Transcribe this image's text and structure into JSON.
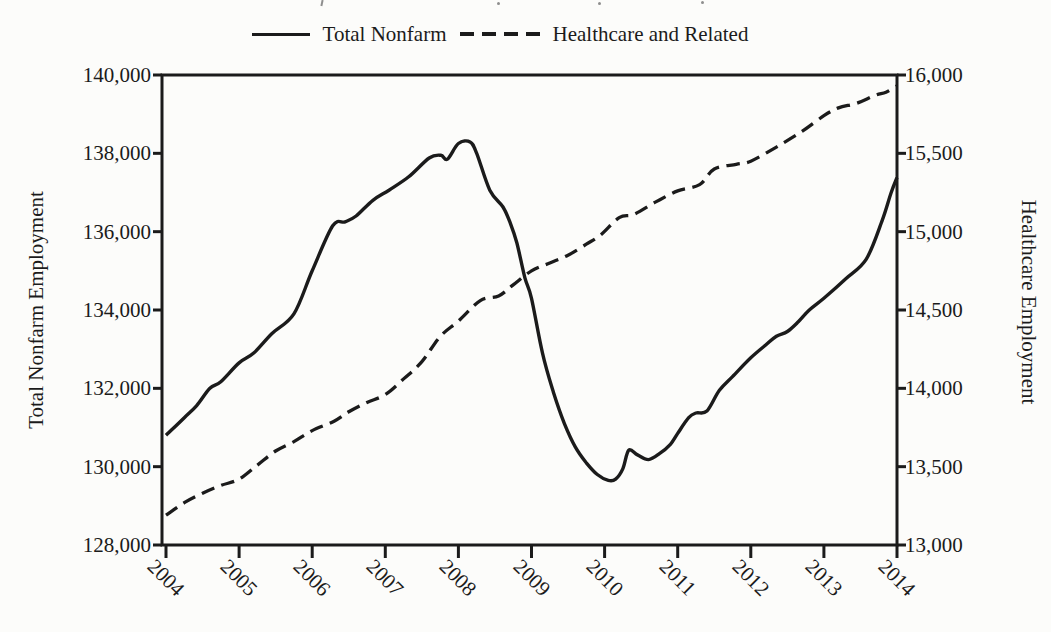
{
  "chart_data": {
    "type": "line",
    "title": "",
    "legend_position": "top-center",
    "grid": false,
    "ink_color": "#1b1b1b",
    "x_axis": {
      "label": "",
      "range": [
        2004,
        2014
      ],
      "tick_labels": [
        "2004",
        "2005",
        "2006",
        "2007",
        "2008",
        "2009",
        "2010",
        "2011",
        "2012",
        "2013",
        "2014"
      ],
      "tick_values": [
        2004,
        2005,
        2006,
        2007,
        2008,
        2009,
        2010,
        2011,
        2012,
        2013,
        2014
      ],
      "tick_label_rotation_deg": 45
    },
    "left_axis": {
      "label": "Total Nonfarm Employment",
      "range": [
        128000,
        140000
      ],
      "tick_step": 2000,
      "tick_labels": [
        "140,000",
        "138,000",
        "136,000",
        "134,000",
        "132,000",
        "130,000",
        "128,000"
      ],
      "tick_values": [
        140000,
        138000,
        136000,
        134000,
        132000,
        130000,
        128000
      ]
    },
    "right_axis": {
      "label": "Healthcare Employment",
      "range": [
        13000,
        16000
      ],
      "tick_step": 500,
      "tick_labels": [
        "16,000",
        "15,500",
        "15,000",
        "14,500",
        "14,000",
        "13,500",
        "13,000"
      ],
      "tick_values": [
        16000,
        15500,
        15000,
        14500,
        14000,
        13500,
        13000
      ]
    },
    "series": [
      {
        "name": "Total Nonfarm",
        "axis": "left",
        "line_style": "solid",
        "x": [
          2004,
          2004.25,
          2004.42,
          2004.6,
          2004.75,
          2005,
          2005.2,
          2005.45,
          2005.75,
          2006,
          2006.28,
          2006.45,
          2006.6,
          2006.83,
          2007.05,
          2007.32,
          2007.6,
          2007.76,
          2007.85,
          2008,
          2008.16,
          2008.25,
          2008.43,
          2008.61,
          2008.71,
          2008.8,
          2008.91,
          2009,
          2009.15,
          2009.3,
          2009.45,
          2009.6,
          2009.75,
          2009.9,
          2010.05,
          2010.15,
          2010.25,
          2010.33,
          2010.45,
          2010.6,
          2010.75,
          2010.9,
          2011,
          2011.15,
          2011.25,
          2011.4,
          2011.57,
          2011.75,
          2012,
          2012.2,
          2012.35,
          2012.5,
          2012.65,
          2012.8,
          2013,
          2013.3,
          2013.58,
          2013.8,
          2013.92,
          2014
        ],
        "values": [
          130800,
          131250,
          131560,
          132000,
          132170,
          132650,
          132900,
          133400,
          133900,
          135000,
          136150,
          136250,
          136400,
          136800,
          137060,
          137400,
          137880,
          137950,
          137850,
          138250,
          138290,
          138000,
          137060,
          136630,
          136220,
          135710,
          134820,
          134300,
          132900,
          131900,
          131100,
          130500,
          130100,
          129800,
          129650,
          129680,
          129950,
          130420,
          130300,
          130180,
          130330,
          130570,
          130850,
          131250,
          131370,
          131420,
          131950,
          132300,
          132780,
          133100,
          133330,
          133450,
          133700,
          134000,
          134300,
          134800,
          135300,
          136300,
          137000,
          137380
        ]
      },
      {
        "name": "Healthcare and Related",
        "axis": "right",
        "line_style": "dashed",
        "x": [
          2004,
          2004.25,
          2004.5,
          2004.75,
          2005,
          2005.25,
          2005.5,
          2005.75,
          2006,
          2006.3,
          2006.5,
          2006.75,
          2007,
          2007.25,
          2007.5,
          2007.75,
          2008,
          2008.3,
          2008.55,
          2008.75,
          2009,
          2009.25,
          2009.5,
          2009.75,
          2009.95,
          2010.2,
          2010.4,
          2010.7,
          2011,
          2011.3,
          2011.5,
          2011.8,
          2012,
          2012.35,
          2012.7,
          2013,
          2013.2,
          2013.45,
          2013.7,
          2013.85,
          2014
        ],
        "values": [
          13190,
          13270,
          13330,
          13380,
          13420,
          13510,
          13600,
          13660,
          13730,
          13790,
          13850,
          13910,
          13960,
          14060,
          14170,
          14330,
          14430,
          14560,
          14590,
          14660,
          14750,
          14800,
          14850,
          14920,
          14980,
          15090,
          15110,
          15190,
          15260,
          15300,
          15400,
          15430,
          15450,
          15540,
          15640,
          15740,
          15790,
          15820,
          15870,
          15890,
          15930
        ]
      }
    ]
  }
}
